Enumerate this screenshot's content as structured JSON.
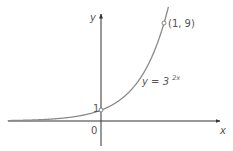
{
  "chart_data": {
    "type": "line",
    "title": "",
    "xlabel": "x",
    "ylabel": "y",
    "origin_label": "0",
    "series": [
      {
        "name": "y = 3^(2x)",
        "label_text": "y = 3",
        "label_exponent": "2x",
        "function": "3^(2x)",
        "x": [
          -1.5,
          -1,
          -0.5,
          0,
          0.25,
          0.5,
          0.75,
          1
        ],
        "values": [
          0.037,
          0.111,
          0.333,
          1,
          1.732,
          3,
          5.196,
          9
        ]
      }
    ],
    "marked_points": [
      {
        "x": 0,
        "y": 1,
        "label": "1"
      },
      {
        "x": 1,
        "y": 9,
        "label": "(1, 9)"
      }
    ],
    "grid": false,
    "legend": "none",
    "colors": {
      "curve": "#8a8a8a",
      "axes": "#333333",
      "text": "#555555"
    }
  }
}
